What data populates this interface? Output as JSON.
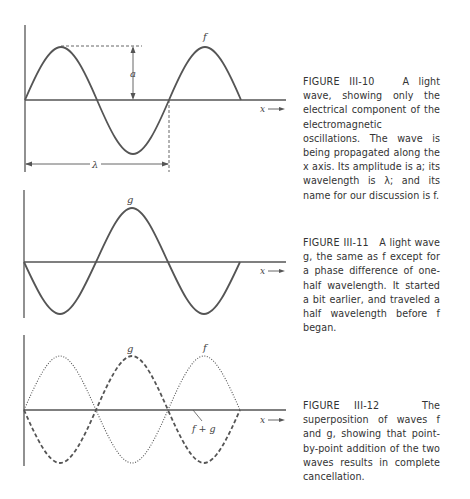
{
  "figures": [
    {
      "id": "III-10",
      "number_label": "FIGURE III-10",
      "caption_text": "A light wave, showing only the electrical component of the electromagnetic oscillations. The wave is being propagated along the x axis. Its amplitude is a; its wavelength is λ; and its name for our discussion is f.",
      "wave_labels": {
        "f": "f",
        "amplitude": "a",
        "wavelength": "λ",
        "axis": "x"
      }
    },
    {
      "id": "III-11",
      "number_label": "FIGURE III-11",
      "caption_text": "A light wave g, the same as f except for a phase difference of one-half wavelength. It started a bit earlier, and traveled a half wavelength before f began.",
      "wave_labels": {
        "g": "g",
        "axis": "x"
      }
    },
    {
      "id": "III-12",
      "number_label": "FIGURE III-12",
      "caption_text": "The superposition of waves f and g, showing that point-by-point addition of the two waves results in complete cancellation.",
      "wave_labels": {
        "f": "f",
        "g": "g",
        "sum": "f + g",
        "axis": "x"
      }
    }
  ],
  "colors": {
    "ink": "#555555",
    "text": "#333333"
  }
}
